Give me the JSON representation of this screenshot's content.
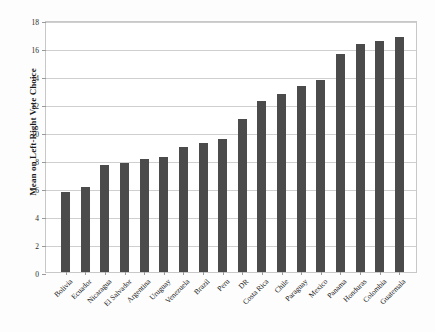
{
  "chart_data": {
    "type": "bar",
    "title": "",
    "subtitle": "",
    "xlabel": "",
    "ylabel": "Mean on Left-Right Vote Choice",
    "ylim": [
      0,
      18
    ],
    "ytick_values": [
      0,
      2,
      4,
      6,
      8,
      10,
      12,
      14,
      16,
      18
    ],
    "ytick_labels": [
      "0",
      "2",
      "4",
      "6",
      "8",
      "10",
      "12",
      "14",
      "16",
      "18"
    ],
    "grid": true,
    "legend": null,
    "legend_position": "none",
    "bar_color": "#4b4b4b",
    "categories": [
      "Bolivia",
      "Ecuador",
      "Nicaragua",
      "El Salvador",
      "Argentina",
      "Uruguay",
      "Venezuela",
      "Brazil",
      "Peru",
      "DR",
      "Costa Rica",
      "Chile",
      "Paraguay",
      "Mexico",
      "Panama",
      "Honduras",
      "Colombia",
      "Guatemala"
    ],
    "values": [
      5.7,
      6.1,
      7.65,
      7.8,
      8.1,
      8.2,
      8.9,
      9.2,
      9.5,
      10.9,
      12.2,
      12.7,
      13.3,
      13.7,
      15.6,
      16.3,
      16.5,
      16.8
    ]
  }
}
